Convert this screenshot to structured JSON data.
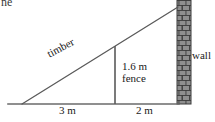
{
  "figure": {
    "title_fragment": "ne",
    "width": 215,
    "height": 122,
    "background": "#ffffff",
    "line_color": "#4a4a4a",
    "brick_fill": "#8c8c8c",
    "brick_mortar": "#3d3d3d",
    "text_color": "#1a1a1a"
  },
  "labels": {
    "timber": "timber",
    "fence_measure": "1.6 m",
    "fence_name": "fence",
    "wall": "wall",
    "dim_left": "3 m",
    "dim_right": "2 m"
  },
  "geometry": {
    "ground_y": 104,
    "ground_x_start": 8,
    "ground_x_end": 179,
    "timber_base_x": 22,
    "timber_base_y": 104,
    "timber_top_x": 178,
    "timber_top_y": 7,
    "fence_x": 115,
    "fence_top_y": 46,
    "fence_bottom_y": 104,
    "wall_x": 177,
    "wall_width": 14,
    "wall_top_y": 0,
    "wall_bottom_y": 104
  },
  "measurements": {
    "fence_height_m": 1.6,
    "base_to_fence_m": 3,
    "fence_to_wall_m": 2,
    "total_base_m": 5,
    "unit": "m"
  }
}
